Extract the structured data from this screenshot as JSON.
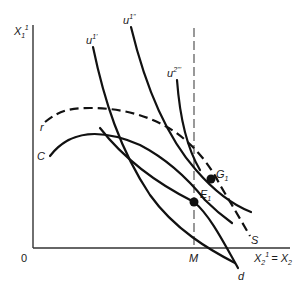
{
  "diagram": {
    "type": "economics-equilibrium-diagram",
    "axes": {
      "y_label_base": "X",
      "y_label_sub": "1",
      "y_label_sup": "1",
      "x_label_base": "X",
      "x_label_sub": "2",
      "x_label_sup": "1",
      "x_label_rhs": "= X",
      "x_label_rhs_sub": "2",
      "origin_label": "0"
    },
    "curves": {
      "u1_prime": {
        "base": "u",
        "sup": "1'"
      },
      "u1_double_prime": {
        "base": "u",
        "sup": "1''"
      },
      "u2_triple_prime": {
        "base": "u",
        "sup": "2'''"
      },
      "r": {
        "label": "r"
      },
      "c": {
        "label": "C"
      },
      "s": {
        "label": "S"
      },
      "d": {
        "label": "d"
      }
    },
    "vertical_marker": {
      "label": "M"
    },
    "points": {
      "e1": {
        "base": "E",
        "sub": "1"
      },
      "g1": {
        "base": "G",
        "sub": "1"
      }
    }
  }
}
